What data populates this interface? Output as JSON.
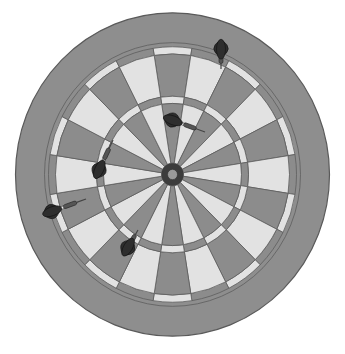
{
  "scene": {
    "title": "Dartboard with five darts",
    "description": "Grayscale illustration of a dartboard with 20 segments and five darts stuck in it"
  },
  "board": {
    "center": [
      172.5,
      174.5
    ],
    "scale_y": 1.03,
    "outer_radius": 157,
    "outer_band_outer": 128,
    "double_outer": 124,
    "double_inner": 117,
    "treble_outer": 76,
    "treble_inner": 69,
    "outer_bull": 11,
    "inner_bull": 5,
    "segments": 20,
    "colors": {
      "background": "#ffffff",
      "rim": "#8e8e8e",
      "rim_edge": "#5a5a5a",
      "light_segment": "#e2e2e2",
      "dark_segment": "#8c8c8c",
      "wire": "#5e5e5e",
      "bull_outer": "#3c3c3c",
      "bull_inner": "#9a9a9a"
    }
  },
  "darts": [
    {
      "name": "dart-top-right",
      "tip": [
        221,
        69
      ],
      "angle": -90,
      "length": 22,
      "flight_color": "#2e2e2e"
    },
    {
      "name": "dart-right",
      "tip": [
        205,
        132
      ],
      "angle": 200,
      "length": 38,
      "flight_color": "#2e2e2e"
    },
    {
      "name": "dart-left-inner",
      "tip": [
        113,
        140
      ],
      "angle": 115,
      "length": 36,
      "flight_color": "#2e2e2e"
    },
    {
      "name": "dart-far-left",
      "tip": [
        86,
        199
      ],
      "angle": 160,
      "length": 40,
      "flight_color": "#2e2e2e"
    },
    {
      "name": "dart-lower-left",
      "tip": [
        138,
        230
      ],
      "angle": 120,
      "length": 22,
      "flight_color": "#2e2e2e"
    }
  ]
}
